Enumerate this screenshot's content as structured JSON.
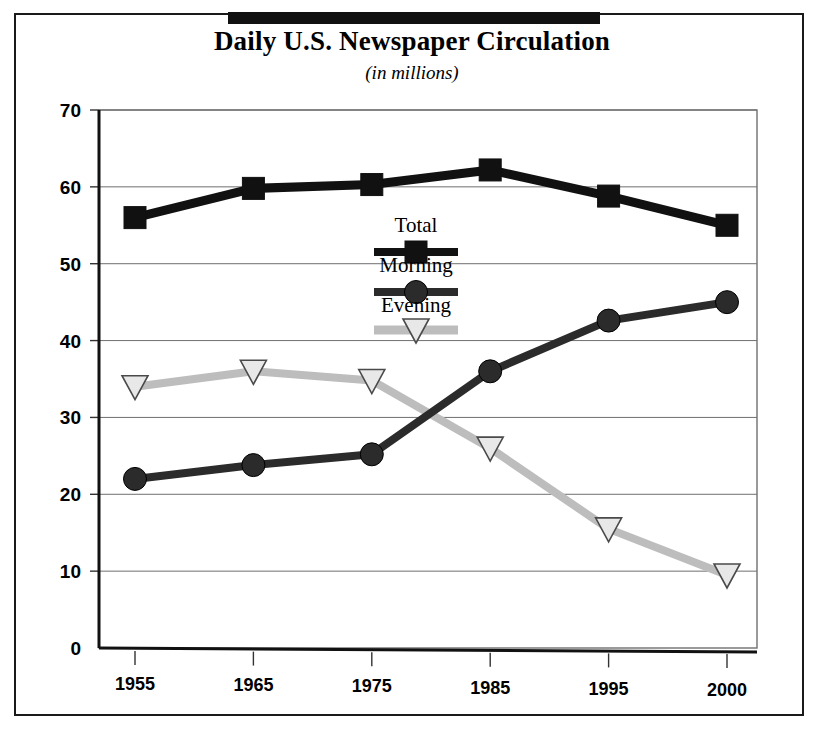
{
  "figure": {
    "title": "Daily U.S. Newspaper Circulation",
    "subtitle": "(in millions)"
  },
  "chart_data": {
    "type": "line",
    "title": "Daily U.S. Newspaper Circulation",
    "subtitle": "(in millions)",
    "xlabel": "",
    "ylabel": "",
    "categories": [
      "1955",
      "1965",
      "1975",
      "1985",
      "1995",
      "2000"
    ],
    "ylim": [
      0,
      70
    ],
    "yticks": [
      "0",
      "10",
      "20",
      "30",
      "40",
      "50",
      "60",
      "70"
    ],
    "grid": true,
    "legend_position": "inside-center",
    "series": [
      {
        "name": "Total",
        "values": [
          56.0,
          59.8,
          60.3,
          62.2,
          58.8,
          55.0
        ],
        "color": "#111111",
        "marker": "square"
      },
      {
        "name": "Morning",
        "values": [
          22.0,
          23.8,
          25.2,
          36.0,
          42.6,
          45.0
        ],
        "color": "#2b2b2b",
        "marker": "circle"
      },
      {
        "name": "Evening",
        "values": [
          34.0,
          36.0,
          34.8,
          26.0,
          15.5,
          9.5
        ],
        "color": "#bdbdbd",
        "marker": "triangle-down"
      }
    ]
  },
  "legend": {
    "items": [
      {
        "label": "Total",
        "marker": "square-marker"
      },
      {
        "label": "Morning",
        "marker": "circle-marker"
      },
      {
        "label": "Evening",
        "marker": "triangle-marker"
      }
    ]
  }
}
